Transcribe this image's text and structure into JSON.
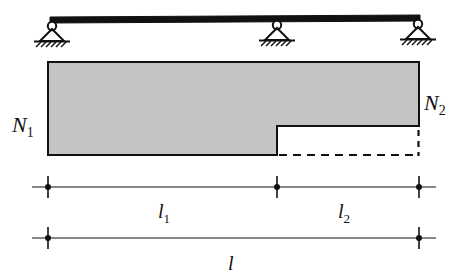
{
  "figure": {
    "colors": {
      "line": "#111111",
      "fill": "#c4c4c4",
      "background": "#ffffff",
      "dashed": "#111111"
    },
    "beam": {
      "supports": [
        {
          "name": "left-support",
          "type": "pin",
          "x": 52
        },
        {
          "name": "middle-support",
          "type": "pin",
          "x": 277
        },
        {
          "name": "right-support",
          "type": "pin",
          "x": 418
        }
      ],
      "span_start_x": 50,
      "span_end_x": 420
    },
    "section": {
      "left_label": "N",
      "left_label_sub": "1",
      "right_label": "N",
      "right_label_sub": "2",
      "step_x": 277,
      "left_x": 48,
      "right_x": 419,
      "top_y": 62,
      "bottom_y": 155,
      "step_y": 126
    },
    "dimensions": [
      {
        "name": "dimension-l1",
        "label": "l",
        "label_sub": "1",
        "from_x": 48,
        "to_x": 277,
        "y": 187
      },
      {
        "name": "dimension-l2",
        "label": "l",
        "label_sub": "2",
        "from_x": 277,
        "to_x": 419,
        "y": 187
      },
      {
        "name": "dimension-l-total",
        "label": "l",
        "label_sub": "",
        "from_x": 48,
        "to_x": 419,
        "y": 238
      }
    ]
  }
}
